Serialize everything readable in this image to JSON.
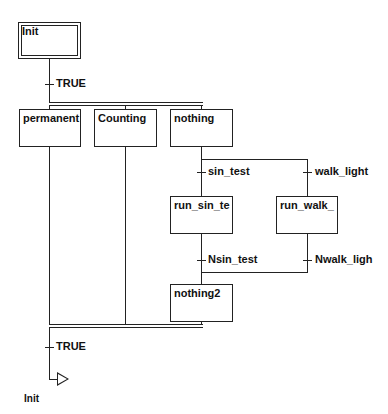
{
  "diagram": {
    "type": "SFC",
    "steps": {
      "init": "Init",
      "permanent": "permanent",
      "counting": "Counting",
      "nothing": "nothing",
      "run_sin_test": "run_sin_te",
      "run_walk_light": "run_walk_",
      "nothing2": "nothing2"
    },
    "transitions": {
      "t_init": "TRUE",
      "sin_test": "sin_test",
      "walk_light": "walk_light",
      "nsin_test": "Nsin_test",
      "nwalk_light": "Nwalk_ligh",
      "t_final": "TRUE"
    },
    "jump": {
      "target": "Init"
    }
  }
}
